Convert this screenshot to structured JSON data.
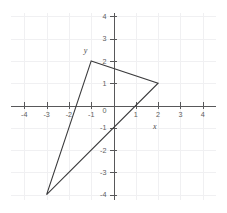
{
  "chart_data": {
    "type": "scatter",
    "title": "",
    "subtitle": "",
    "xlabel": "x",
    "ylabel": "y",
    "xlim": [
      -4.6,
      4.6
    ],
    "ylim": [
      -4.6,
      4.6
    ],
    "grid": true,
    "legend": null,
    "legend_position": "none",
    "x_ticks": [
      -4,
      -3,
      -2,
      -1,
      0,
      1,
      2,
      3,
      4
    ],
    "y_ticks": [
      4,
      3,
      2,
      1,
      0,
      -1,
      -2,
      -3,
      -4
    ],
    "x_tick_labels": [
      "-4",
      "-3",
      "-2",
      "-1",
      "0",
      "1",
      "2",
      "3",
      "4"
    ],
    "y_tick_labels": [
      "4",
      "3",
      "2",
      "1",
      "0",
      "-1",
      "-2",
      "-3",
      "-4"
    ],
    "origin_label": "0",
    "shapes": [
      {
        "name": "triangle",
        "closed": true,
        "stroke": "#3a3a3c",
        "fill": "none",
        "points": [
          {
            "x": -1,
            "y": 2
          },
          {
            "x": 2,
            "y": 1
          },
          {
            "x": -3,
            "y": -4
          }
        ]
      }
    ],
    "series": [],
    "annotations": [
      {
        "text": "y",
        "x": -1.25,
        "y": 2.35,
        "style": "axis-name"
      },
      {
        "text": "x",
        "x": 1.85,
        "y": -1.05,
        "style": "axis-name"
      }
    ],
    "colors": {
      "background": "#ffffff",
      "grid": "#f0f0f2",
      "axis": "#58585a",
      "tick_text": "#5d5d5d",
      "shape_stroke": "#3a3a3c"
    },
    "geometry": {
      "origin_px": {
        "x": 113.5,
        "y": 105.5
      },
      "unit_px": 22.3,
      "grid_extent_px": {
        "left": 11,
        "right": 216,
        "top": 13,
        "bottom": 200
      }
    }
  }
}
